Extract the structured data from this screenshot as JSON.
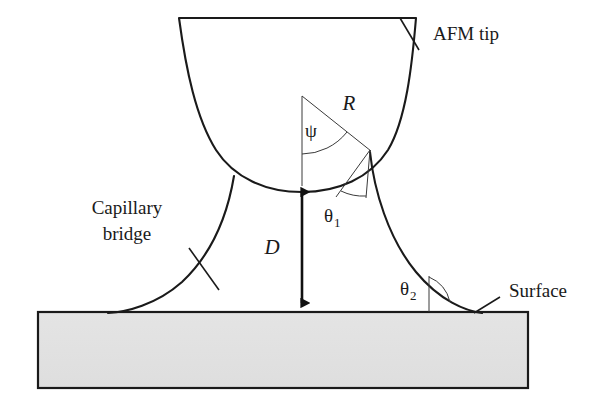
{
  "figure": {
    "background_color": "#ffffff",
    "outline_color": "#1a1a1a",
    "fill_color": "#e2e2e2",
    "thin_line_color": "#3a3a3a"
  },
  "labels": {
    "afm_tip": "AFM tip",
    "capillary_bridge_line1": "Capillary",
    "capillary_bridge_line2": "bridge",
    "surface": "Surface",
    "radius": "R",
    "half_angle": "ψ",
    "separation": "D",
    "contact_angle_1": "θ",
    "contact_angle_1_sub": "1",
    "contact_angle_2": "θ",
    "contact_angle_2_sub": "2"
  },
  "geometry": {
    "tip_apex": {
      "x": 302,
      "y": 183
    },
    "sphere_center": {
      "x": 302,
      "y": 98
    },
    "radius_endpoint": {
      "x": 370,
      "y": 150
    },
    "substrate": {
      "x": 38,
      "y": 312,
      "width": 490,
      "height": 76
    },
    "dimension_top": {
      "x": 302,
      "y": 183
    },
    "dimension_bottom": {
      "x": 302,
      "y": 312
    }
  }
}
